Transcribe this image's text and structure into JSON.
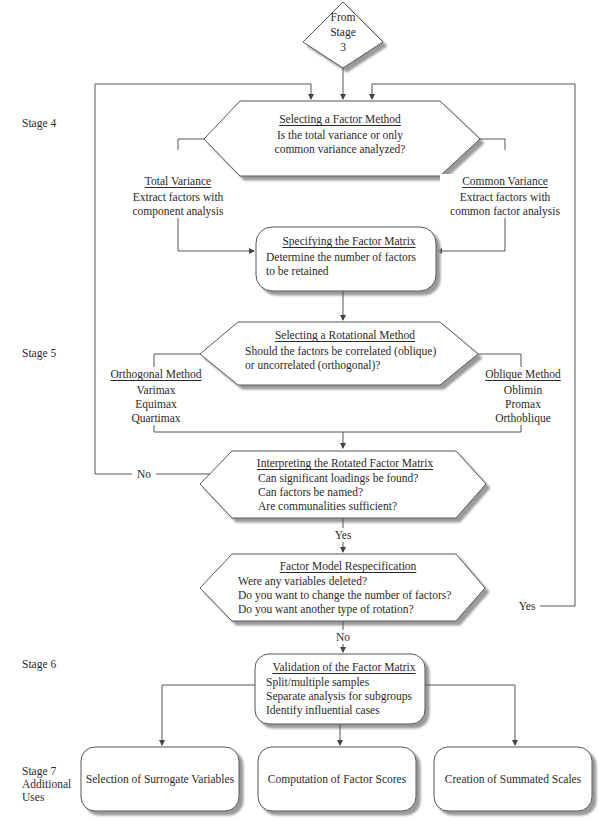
{
  "stages": {
    "stage4": "Stage 4",
    "stage5": "Stage 5",
    "stage6": "Stage 6",
    "stage7": [
      "Stage 7",
      "Additional",
      "Uses"
    ]
  },
  "start": {
    "lines": [
      "From",
      "Stage",
      "3"
    ]
  },
  "factor_method": {
    "title": "Selecting a Factor Method",
    "lines": [
      "Is the total variance or only",
      "common variance analyzed?"
    ]
  },
  "total_variance": {
    "title": "Total Variance",
    "lines": [
      "Extract factors with",
      "component analysis"
    ]
  },
  "common_variance": {
    "title": "Common Variance",
    "lines": [
      "Extract factors with",
      "common factor analysis"
    ]
  },
  "factor_matrix": {
    "title": "Specifying the Factor Matrix",
    "lines": [
      "Determine the number of factors",
      "to be retained"
    ]
  },
  "rotational_method": {
    "title": "Selecting a Rotational Method",
    "lines": [
      "Should the factors be correlated (oblique)",
      "or uncorrelated (orthogonal)?"
    ]
  },
  "orthogonal": {
    "title": "Orthogonal Method",
    "lines": [
      "Varimax",
      "Equimax",
      "Quartimax"
    ]
  },
  "oblique": {
    "title": "Oblique Method",
    "lines": [
      "Oblimin",
      "Promax",
      "Orthoblique"
    ]
  },
  "interpreting": {
    "title": "Interpreting the Rotated Factor Matrix",
    "lines": [
      "Can significant loadings be found?",
      "Can factors be named?",
      "Are communalities sufficient?"
    ]
  },
  "respecification": {
    "title": "Factor Model Respecification",
    "lines": [
      "Were any variables deleted?",
      "Do you want to change the number of factors?",
      "Do you want another type of rotation?"
    ]
  },
  "validation": {
    "title": "Validation of the Factor Matrix",
    "lines": [
      "Split/multiple samples",
      "Separate analysis for subgroups",
      "Identify influential cases"
    ]
  },
  "uses": [
    "Selection of Surrogate Variables",
    "Computation of Factor Scores",
    "Creation of Summated Scales"
  ],
  "edge_labels": {
    "interpreting_no": "No",
    "interpreting_yes": "Yes",
    "respec_yes": "Yes",
    "respec_no": "No"
  },
  "colors": {
    "line": "#555555",
    "shadow": "#a8a8a8",
    "text": "#2a2a2a"
  }
}
